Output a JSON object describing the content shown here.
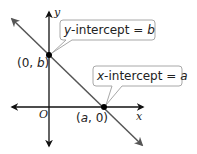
{
  "diagram": {
    "type": "coordinate-plane-intercepts",
    "axes": {
      "x_label": "x",
      "y_label": "y",
      "origin_label": "O"
    },
    "points": [
      {
        "label": "(0, b)",
        "name": "y-intercept-point"
      },
      {
        "label": "(a, 0)",
        "name": "x-intercept-point"
      }
    ],
    "callouts": {
      "y_intercept": {
        "var": "y",
        "text": "-intercept = ",
        "value": "b"
      },
      "x_intercept": {
        "var": "x",
        "text": "-intercept = ",
        "value": "a"
      }
    },
    "colors": {
      "axis": "#111111",
      "line": "#4a4a4a",
      "callout_border": "#a8a8a8",
      "point": "#000000"
    }
  }
}
